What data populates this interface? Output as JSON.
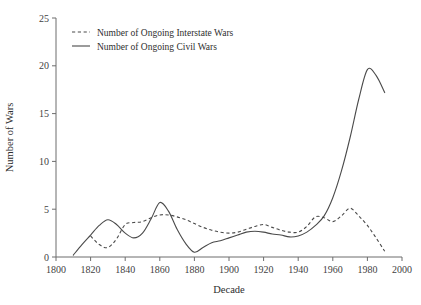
{
  "chart_data": {
    "type": "line",
    "title": "",
    "xlabel": "Decade",
    "ylabel": "Number of Wars",
    "xlim": [
      1800,
      2000
    ],
    "ylim": [
      0,
      25
    ],
    "xticks": [
      1800,
      1820,
      1840,
      1860,
      1880,
      1900,
      1920,
      1940,
      1960,
      1980,
      2000
    ],
    "yticks": [
      0,
      5,
      10,
      15,
      20,
      25
    ],
    "grid": false,
    "legend_position": "top-left",
    "series": [
      {
        "name": "Number of Ongoing Interstate Wars",
        "style": "dashed",
        "color": "#4a4a4a",
        "x": [
          1820,
          1825,
          1830,
          1835,
          1840,
          1845,
          1850,
          1855,
          1860,
          1865,
          1870,
          1875,
          1880,
          1885,
          1890,
          1895,
          1900,
          1905,
          1910,
          1915,
          1920,
          1925,
          1930,
          1935,
          1940,
          1945,
          1950,
          1955,
          1960,
          1965,
          1970,
          1975,
          1980,
          1985,
          1990
        ],
        "values": [
          2.2,
          1.3,
          1.0,
          1.9,
          3.4,
          3.6,
          3.7,
          4.1,
          4.4,
          4.4,
          4.2,
          3.9,
          3.5,
          3.1,
          2.8,
          2.6,
          2.5,
          2.6,
          2.9,
          3.2,
          3.4,
          3.1,
          2.8,
          2.6,
          2.6,
          3.2,
          4.2,
          4.1,
          3.7,
          4.3,
          5.1,
          4.3,
          3.3,
          2.0,
          0.6
        ]
      },
      {
        "name": "Number of Ongoing Civil Wars",
        "style": "solid",
        "color": "#4a4a4a",
        "x": [
          1810,
          1815,
          1820,
          1825,
          1830,
          1835,
          1840,
          1845,
          1850,
          1855,
          1860,
          1865,
          1870,
          1875,
          1880,
          1885,
          1890,
          1895,
          1900,
          1905,
          1910,
          1915,
          1920,
          1925,
          1930,
          1935,
          1940,
          1945,
          1950,
          1955,
          1960,
          1965,
          1970,
          1975,
          1980,
          1985,
          1990
        ],
        "values": [
          0.2,
          1.3,
          2.3,
          3.3,
          3.9,
          3.4,
          2.5,
          2.0,
          2.5,
          4.0,
          5.7,
          4.8,
          2.9,
          1.4,
          0.5,
          1.0,
          1.5,
          1.7,
          2.0,
          2.3,
          2.6,
          2.7,
          2.6,
          2.4,
          2.3,
          2.1,
          2.2,
          2.6,
          3.3,
          4.3,
          6.2,
          9.0,
          12.5,
          16.5,
          19.6,
          19.0,
          17.2
        ]
      }
    ],
    "annotations": {
      "civil_peak_year": 1980,
      "civil_peak_value": 19.6,
      "interstate_peak_year": 1970,
      "interstate_peak_value": 5.1
    }
  },
  "legend": {
    "items": [
      {
        "label": "Number of Ongoing Interstate Wars",
        "style": "dashed"
      },
      {
        "label": "Number of Ongoing Civil Wars",
        "style": "solid"
      }
    ]
  },
  "axes": {
    "x_title": "Decade",
    "y_title": "Number of Wars",
    "x_tick_labels": [
      "1800",
      "1820",
      "1840",
      "1860",
      "1880",
      "1900",
      "1920",
      "1940",
      "1960",
      "1980",
      "2000"
    ],
    "y_tick_labels": [
      "0",
      "5",
      "10",
      "15",
      "20",
      "25"
    ]
  },
  "colors": {
    "line": "#4a4a4a",
    "axis": "#6d6d6d",
    "text": "#2e2e2e",
    "background": "#ffffff"
  }
}
